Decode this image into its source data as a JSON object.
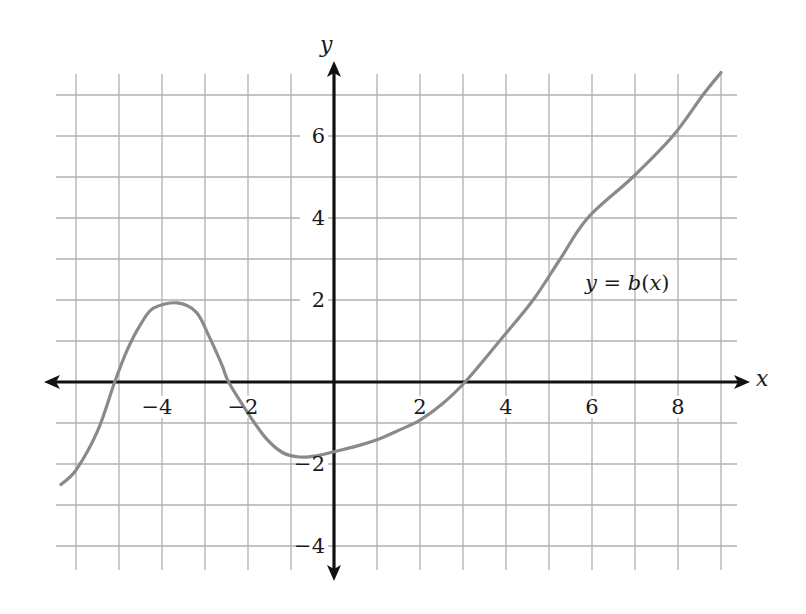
{
  "chart_data": {
    "type": "line",
    "title": "",
    "xlabel": "x",
    "ylabel": "y",
    "xlim": [
      -6.5,
      9.5
    ],
    "ylim": [
      -4.5,
      7.5
    ],
    "grid": true,
    "grid_step": 1,
    "x_ticks": [
      -4,
      -2,
      2,
      4,
      6,
      8
    ],
    "y_ticks": [
      -4,
      -2,
      2,
      4,
      6
    ],
    "x_tick_labels": [
      "−4",
      "−2",
      "2",
      "4",
      "6",
      "8"
    ],
    "y_tick_labels": [
      "−4",
      "−2",
      "2",
      "4",
      "6"
    ],
    "annotations": [
      {
        "text": "y = b(x)",
        "x": 6.8,
        "y": 2.4
      }
    ],
    "series": [
      {
        "name": "y = b(x)",
        "color": "#8a8a8a",
        "points": [
          [
            -6.35,
            -2.5
          ],
          [
            -6.0,
            -2.15
          ],
          [
            -5.5,
            -1.2
          ],
          [
            -5.1,
            0.0
          ],
          [
            -4.8,
            0.8
          ],
          [
            -4.5,
            1.4
          ],
          [
            -4.2,
            1.8
          ],
          [
            -3.65,
            1.93
          ],
          [
            -3.2,
            1.7
          ],
          [
            -2.9,
            1.1
          ],
          [
            -2.6,
            0.4
          ],
          [
            -2.45,
            0.0
          ],
          [
            -2.0,
            -0.76
          ],
          [
            -1.6,
            -1.35
          ],
          [
            -1.2,
            -1.72
          ],
          [
            -0.8,
            -1.83
          ],
          [
            -0.4,
            -1.8
          ],
          [
            0.0,
            -1.7
          ],
          [
            0.5,
            -1.57
          ],
          [
            1.0,
            -1.41
          ],
          [
            1.5,
            -1.18
          ],
          [
            2.0,
            -0.93
          ],
          [
            2.5,
            -0.55
          ],
          [
            3.05,
            0.0
          ],
          [
            3.85,
            1.0
          ],
          [
            4.63,
            2.0
          ],
          [
            5.26,
            3.0
          ],
          [
            5.9,
            4.0
          ],
          [
            6.95,
            5.0
          ],
          [
            7.88,
            6.0
          ],
          [
            8.58,
            7.0
          ],
          [
            9.0,
            7.55
          ]
        ]
      }
    ]
  },
  "labels": {
    "x_axis": "x",
    "y_axis": "y",
    "function": "y = b(x)"
  },
  "colors": {
    "axis": "#111111",
    "grid": "#b0b0b0",
    "curve": "#8a8a8a"
  }
}
